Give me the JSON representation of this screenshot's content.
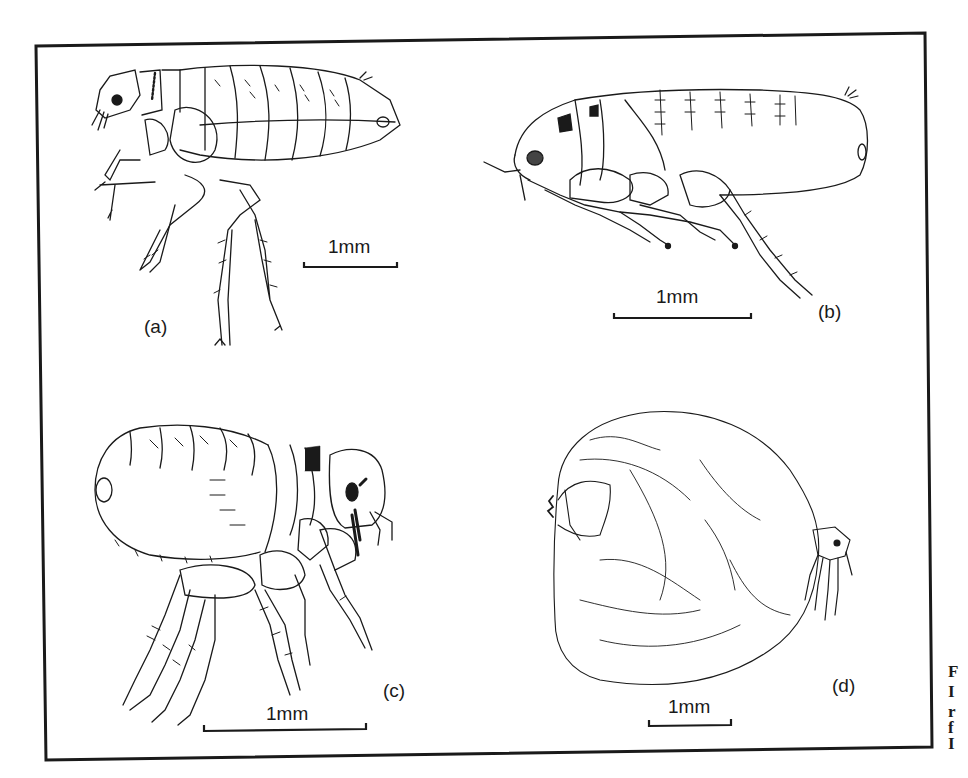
{
  "figure": {
    "panels": [
      {
        "id": "a",
        "label": "(a)",
        "scale_label": "1mm",
        "subject": "adult flea, lateral view"
      },
      {
        "id": "b",
        "label": "(b)",
        "scale_label": "1mm",
        "subject": "adult flea, lateral view"
      },
      {
        "id": "c",
        "label": "(c)",
        "scale_label": "1mm",
        "subject": "adult flea, lateral view"
      },
      {
        "id": "d",
        "label": "(d)",
        "scale_label": "1mm",
        "subject": "engorged female flea (neosomic), lateral view"
      }
    ],
    "caption_fragments": [
      "F",
      "I",
      "r",
      "f",
      "I"
    ],
    "colors": {
      "ink": "#1a1a1a",
      "paper": "#ffffff"
    }
  }
}
